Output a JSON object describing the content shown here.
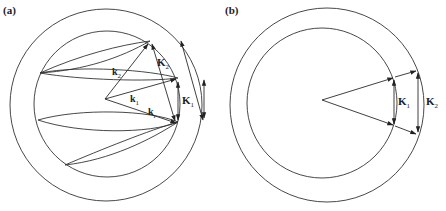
{
  "figure": {
    "panels": [
      {
        "id": "a",
        "label": "(a)",
        "vectors": {
          "k2": {
            "main": "k",
            "sub": "2"
          },
          "k1": {
            "main": "k",
            "sub": "1"
          },
          "kr": {
            "main": "k",
            "sub": "r"
          },
          "K2": {
            "main": "K",
            "sub": "2"
          },
          "K1": {
            "main": "K",
            "sub": "1"
          }
        },
        "description": "Two concentric circles (Ewald-like spheres) with wavevectors k1, k2, kr from center, scattering vectors K1 and K2, and elliptical cones"
      },
      {
        "id": "b",
        "label": "(b)",
        "vectors": {
          "K1": {
            "main": "K",
            "sub": "1"
          },
          "K2": {
            "main": "K",
            "sub": "2"
          }
        },
        "description": "Two concentric circles with two wavevectors from center; K1 chord on inner circle, K2 chord on outer circle"
      }
    ],
    "colors": {
      "line": "#333333",
      "background": "#ffffff"
    }
  }
}
